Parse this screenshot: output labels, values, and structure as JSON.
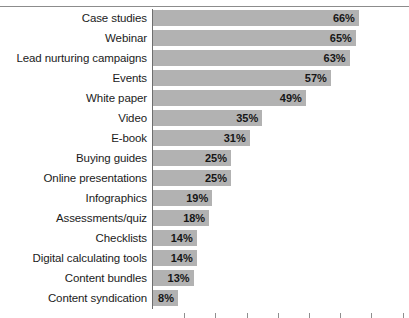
{
  "chart_data": {
    "type": "bar",
    "orientation": "horizontal",
    "title": "",
    "subtitle": "",
    "xlabel": "",
    "ylabel": "",
    "xlim": [
      0,
      70
    ],
    "grid": false,
    "legend": null,
    "value_suffix": "%",
    "bar_color": "#b2b2b2",
    "axis_color": "#6e6e6e",
    "tick_interval": 10,
    "categories": [
      "Case studies",
      "Webinar",
      "Lead nurturing campaigns",
      "Events",
      "White paper",
      "Video",
      "E-book",
      "Buying guides",
      "Online presentations",
      "Infographics",
      "Assessments/quiz",
      "Checklists",
      "Digital calculating tools",
      "Content bundles",
      "Content syndication"
    ],
    "values": [
      66,
      65,
      63,
      57,
      49,
      35,
      31,
      25,
      25,
      19,
      18,
      14,
      14,
      13,
      8
    ],
    "value_labels": [
      "66%",
      "65%",
      "63%",
      "57%",
      "49%",
      "35%",
      "31%",
      "25%",
      "25%",
      "19%",
      "18%",
      "14%",
      "14%",
      "13%",
      "8%"
    ],
    "ticks": [
      10,
      20,
      30,
      40,
      50,
      60,
      70,
      80
    ],
    "tick_labels": [
      "",
      "",
      "",
      "",
      "",
      "",
      "",
      ""
    ]
  }
}
